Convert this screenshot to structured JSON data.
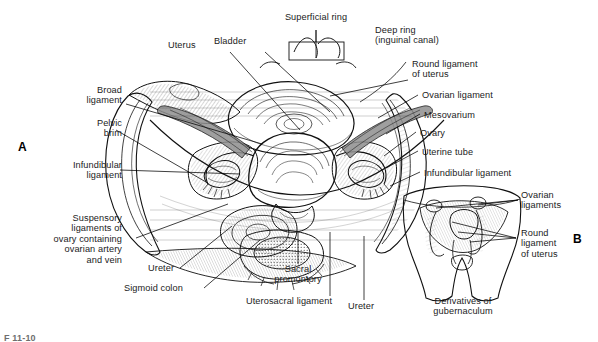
{
  "figure": {
    "caption_id": "F 11-10",
    "panels": [
      {
        "id": "A",
        "letter": "A",
        "sublabel": ""
      },
      {
        "id": "B",
        "letter": "B",
        "sublabel": "Derivatives of\ngubernaculum"
      }
    ]
  },
  "panel_a": {
    "letter": "A",
    "labels_top": [
      {
        "key": "superficial_ring",
        "text": "Superficial ring"
      },
      {
        "key": "deep_ring",
        "text": "Deep ring\n(inguinal canal)"
      },
      {
        "key": "uterus",
        "text": "Uterus"
      },
      {
        "key": "bladder",
        "text": "Bladder"
      }
    ],
    "labels_left": [
      {
        "key": "broad_ligament",
        "text": "Broad\nligament"
      },
      {
        "key": "pelvic_brim",
        "text": "Pelvic\nbrim"
      },
      {
        "key": "infundibular_ligament_left",
        "text": "Infundibular\nligament"
      },
      {
        "key": "suspensory_ligaments",
        "text": "Suspensory\nligaments of\novary containing\novarian artery\nand vein"
      }
    ],
    "labels_right": [
      {
        "key": "round_ligament_of_uterus",
        "text": "Round ligament\nof uterus"
      },
      {
        "key": "ovarian_ligament",
        "text": "Ovarian ligament"
      },
      {
        "key": "mesovarium",
        "text": "Mesovarium"
      },
      {
        "key": "ovary",
        "text": "Ovary"
      },
      {
        "key": "uterine_tube",
        "text": "Uterine tube"
      },
      {
        "key": "infundibular_ligament_right",
        "text": "Infundibular ligament"
      }
    ],
    "labels_bottom": [
      {
        "key": "ureter_left",
        "text": "Ureter"
      },
      {
        "key": "sigmoid_colon",
        "text": "Sigmoid colon"
      },
      {
        "key": "sacral_promontory",
        "text": "Sacral\npromontory"
      },
      {
        "key": "uterosacral_ligament",
        "text": "Uterosacral ligament"
      },
      {
        "key": "ureter_right",
        "text": "Ureter"
      }
    ]
  },
  "panel_b": {
    "letter": "B",
    "labels": [
      {
        "key": "ovarian_ligaments",
        "text": "Ovarian\nligaments"
      },
      {
        "key": "round_ligament_of_uterus_b",
        "text": "Round\nligament\nof uterus"
      }
    ],
    "title": "Derivatives of\ngubernaculum"
  },
  "colors": {
    "ink": "#111111",
    "background": "#ffffff",
    "shade_dark": "#8f8f8f",
    "shade_mid": "#c9c9c9",
    "caption_gray": "#6e6e6e"
  }
}
